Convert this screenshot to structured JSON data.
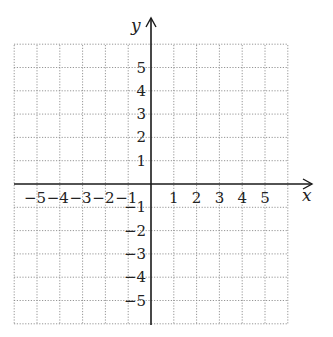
{
  "chart_data": {
    "type": "scatter",
    "title": "",
    "xlabel": "x",
    "ylabel": "y",
    "xlim": [
      -6,
      6
    ],
    "ylim": [
      -6,
      6
    ],
    "grid": true,
    "grid_style": "dotted",
    "x_ticks": [
      -5,
      -4,
      -3,
      -2,
      -1,
      1,
      2,
      3,
      4,
      5
    ],
    "y_ticks": [
      5,
      4,
      3,
      2,
      1,
      -1,
      -2,
      -3,
      -4,
      -5
    ],
    "x_tick_labels": [
      "−5",
      "−4",
      "−3",
      "−2",
      "−1",
      "1",
      "2",
      "3",
      "4",
      "5"
    ],
    "y_tick_labels": [
      "5",
      "4",
      "3",
      "2",
      "1",
      "−1",
      "−2",
      "−3",
      "−4",
      "−5"
    ],
    "series": [],
    "legend": null
  },
  "colors": {
    "axis": "#1a1a1a",
    "grid": "#8a8a8a",
    "background": "#ffffff"
  },
  "layout": {
    "origin_px": [
      151,
      184
    ],
    "unit_px_x": 22.8,
    "unit_px_y": 23.3,
    "grid_left": 14,
    "grid_right": 288,
    "grid_top": 45,
    "grid_bottom": 325
  }
}
